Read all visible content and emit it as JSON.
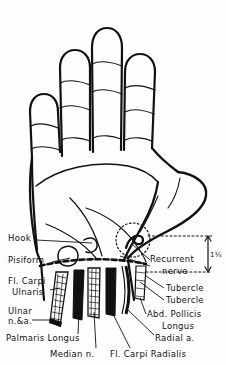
{
  "figure": {
    "view": "palmar (volar) aspect of right hand",
    "ink_color": "#111111",
    "paper_color": "#fefefe"
  },
  "labels_left": [
    {
      "id": "hook",
      "text": "Hook",
      "x": 8,
      "y": 238
    },
    {
      "id": "pisiform",
      "text": "Pisiform",
      "x": 8,
      "y": 260
    },
    {
      "id": "fl-carpi-ulnaris-1",
      "text": "Fl. Carpi",
      "x": 8,
      "y": 281
    },
    {
      "id": "fl-carpi-ulnaris-2",
      "text": "Ulnaris",
      "x": 12,
      "y": 291
    },
    {
      "id": "ulnar-1",
      "text": "Ulnar",
      "x": 8,
      "y": 310
    },
    {
      "id": "ulnar-2",
      "text": "n.&a.",
      "x": 8,
      "y": 320
    },
    {
      "id": "palmaris-longus",
      "text": "Palmaris Longus",
      "x": 6,
      "y": 338
    },
    {
      "id": "median-nerve",
      "text": "Median n.",
      "x": 50,
      "y": 352
    }
  ],
  "labels_right": [
    {
      "id": "recurrent-nerve-1",
      "text": "Recurrent",
      "x": 152,
      "y": 258
    },
    {
      "id": "recurrent-nerve-2",
      "text": "nerve",
      "x": 162,
      "y": 270
    },
    {
      "id": "tubercle-1",
      "text": "Tubercle",
      "x": 166,
      "y": 288
    },
    {
      "id": "tubercle-2",
      "text": "Tubercle",
      "x": 166,
      "y": 300
    },
    {
      "id": "abd-pollicis-1",
      "text": "Abd. Pollicis",
      "x": 148,
      "y": 314
    },
    {
      "id": "abd-pollicis-2",
      "text": "Longus",
      "x": 162,
      "y": 325
    },
    {
      "id": "radial-artery",
      "text": "Radial a.",
      "x": 156,
      "y": 338
    },
    {
      "id": "fl-carpi-radialis",
      "text": "Fl. Carpi Radialis",
      "x": 112,
      "y": 352
    }
  ],
  "dimension": {
    "id": "measure-1-quarter",
    "value": "1¼",
    "unit": "in",
    "text": "1¼",
    "x": 205,
    "y": 262,
    "orientation": "vertical",
    "description": "distance from distal wrist crease to recurrent nerve level"
  },
  "anatomy": {
    "fingers": [
      "index",
      "middle",
      "ring",
      "little"
    ],
    "structures": [
      "hook of hamate",
      "pisiform",
      "flexor carpi ulnaris tendon",
      "ulnar nerve and artery",
      "palmaris longus tendon",
      "median nerve",
      "flexor carpi radialis tendon",
      "abductor pollicis longus",
      "radial artery",
      "scaphoid tubercle",
      "trapezium tubercle",
      "recurrent motor branch of median nerve"
    ],
    "wrist_crease": "dashed heavy line across distal wrist",
    "recurrent_nerve_marker": "dotted circle over thenar eminence"
  }
}
